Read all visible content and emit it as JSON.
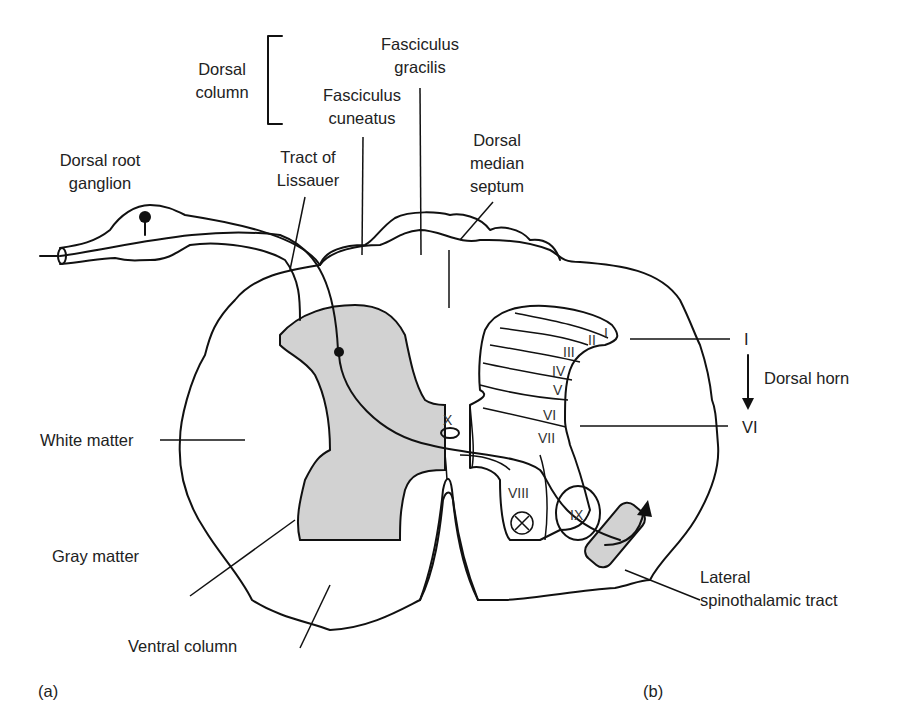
{
  "figure": {
    "panel_labels": {
      "a": "(a)",
      "b": "(b)"
    },
    "labels": {
      "dorsal_column_1": "Dorsal",
      "dorsal_column_2": "column",
      "fasc_gracilis_1": "Fasciculus",
      "fasc_gracilis_2": "gracilis",
      "fasc_cuneatus_1": "Fasciculus",
      "fasc_cuneatus_2": "cuneatus",
      "dorsal_median_1": "Dorsal",
      "dorsal_median_2": "median",
      "dorsal_median_3": "septum",
      "drg_1": "Dorsal root",
      "drg_2": "ganglion",
      "lissauer_1": "Tract of",
      "lissauer_2": "Lissauer",
      "white_matter": "White matter",
      "gray_matter": "Gray matter",
      "ventral_column": "Ventral column",
      "lst_1": "Lateral",
      "lst_2": "spinothalamic tract",
      "dorsal_horn": "Dorsal horn",
      "range_top": "I",
      "range_bottom": "VI"
    },
    "laminae": [
      "I",
      "II",
      "III",
      "IV",
      "V",
      "VI",
      "VII",
      "VIII",
      "IX",
      "IX",
      "X"
    ]
  }
}
